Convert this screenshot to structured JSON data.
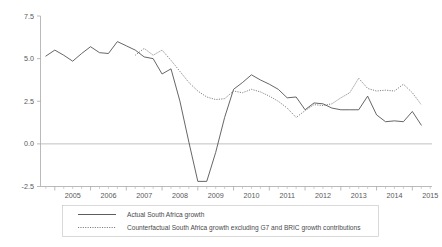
{
  "chart_data": {
    "type": "line",
    "title": "",
    "subtitle": "",
    "xlabel": "",
    "ylabel": "",
    "ylim": [
      -2.5,
      7.5
    ],
    "xlim": [
      "2004Q4",
      "2015Q2"
    ],
    "grid": false,
    "legend_position": "bottom",
    "y_ticks": [
      "7.5",
      "5.0",
      "2.5",
      "0.0",
      "-2.5"
    ],
    "y_tick_values": [
      7.5,
      5.0,
      2.5,
      0.0,
      -2.5
    ],
    "x_ticks": [
      "2005",
      "2006",
      "2007",
      "2008",
      "2009",
      "2010",
      "2011",
      "2012",
      "2013",
      "2014",
      "2015"
    ],
    "x_tick_values": [
      2005,
      2006,
      2007,
      2008,
      2009,
      2010,
      2011,
      2012,
      2013,
      2014,
      2015
    ],
    "x_minor_ticks_per_year": 4,
    "zero_line": 0.0,
    "series": [
      {
        "name": "Actual South Africa growth",
        "style": "solid",
        "color": "#4a4a4c",
        "x": [
          "2004Q4",
          "2005Q1",
          "2005Q2",
          "2005Q3",
          "2005Q4",
          "2006Q1",
          "2006Q2",
          "2006Q3",
          "2006Q4",
          "2007Q1",
          "2007Q2",
          "2007Q3",
          "2007Q4",
          "2008Q1",
          "2008Q2",
          "2008Q3",
          "2008Q4",
          "2009Q1",
          "2009Q2",
          "2009Q3",
          "2009Q4",
          "2010Q1",
          "2010Q2",
          "2010Q3",
          "2010Q4",
          "2011Q1",
          "2011Q2",
          "2011Q3",
          "2011Q4",
          "2012Q1",
          "2012Q2",
          "2012Q3",
          "2012Q4",
          "2013Q1",
          "2013Q2",
          "2013Q3",
          "2013Q4",
          "2014Q1",
          "2014Q2",
          "2014Q3",
          "2014Q4",
          "2015Q1",
          "2015Q2"
        ],
        "x_numeric": [
          2004.75,
          2005.0,
          2005.25,
          2005.5,
          2005.75,
          2006.0,
          2006.25,
          2006.5,
          2006.75,
          2007.0,
          2007.25,
          2007.5,
          2007.75,
          2008.0,
          2008.25,
          2008.5,
          2008.75,
          2009.0,
          2009.25,
          2009.5,
          2009.75,
          2010.0,
          2010.25,
          2010.5,
          2010.75,
          2011.0,
          2011.25,
          2011.5,
          2011.75,
          2012.0,
          2012.25,
          2012.5,
          2012.75,
          2013.0,
          2013.25,
          2013.5,
          2013.75,
          2014.0,
          2014.25,
          2014.5,
          2014.75,
          2015.0,
          2015.25
        ],
        "values": [
          5.15,
          5.5,
          5.2,
          4.85,
          5.3,
          5.7,
          5.35,
          5.3,
          6.0,
          5.75,
          5.5,
          5.1,
          5.0,
          4.1,
          4.4,
          2.5,
          0.1,
          -2.2,
          -2.2,
          -0.5,
          1.55,
          3.2,
          3.6,
          4.05,
          3.75,
          3.5,
          3.2,
          2.7,
          2.75,
          2.0,
          2.4,
          2.35,
          2.1,
          2.0,
          2.0,
          2.0,
          2.8,
          1.7,
          1.3,
          1.35,
          1.3,
          1.9,
          1.1
        ]
      },
      {
        "name": "Counterfactual South Africa growth excluding G7 and BRIC growth contributions",
        "style": "dotted",
        "color": "#6b6b6d",
        "x": [
          "2007Q2",
          "2007Q3",
          "2007Q4",
          "2008Q1",
          "2008Q2",
          "2008Q3",
          "2008Q4",
          "2009Q1",
          "2009Q2",
          "2009Q3",
          "2009Q4",
          "2010Q1",
          "2010Q2",
          "2010Q3",
          "2010Q4",
          "2011Q1",
          "2011Q2",
          "2011Q3",
          "2011Q4",
          "2012Q1",
          "2012Q2",
          "2012Q3",
          "2012Q4",
          "2013Q1",
          "2013Q2",
          "2013Q3",
          "2013Q4",
          "2014Q1",
          "2014Q2",
          "2014Q3",
          "2014Q4",
          "2015Q1",
          "2015Q2"
        ],
        "x_numeric": [
          2007.25,
          2007.5,
          2007.75,
          2008.0,
          2008.25,
          2008.5,
          2008.75,
          2009.0,
          2009.25,
          2009.5,
          2009.75,
          2010.0,
          2010.25,
          2010.5,
          2010.75,
          2011.0,
          2011.25,
          2011.5,
          2011.75,
          2012.0,
          2012.25,
          2012.5,
          2012.75,
          2013.0,
          2013.25,
          2013.5,
          2013.75,
          2014.0,
          2014.25,
          2014.5,
          2014.75,
          2015.0,
          2015.25
        ],
        "values": [
          5.2,
          5.6,
          5.2,
          5.5,
          4.9,
          4.25,
          3.6,
          3.1,
          2.75,
          2.6,
          2.65,
          3.1,
          3.0,
          3.2,
          3.05,
          2.8,
          2.5,
          2.1,
          1.55,
          1.95,
          2.3,
          2.25,
          2.35,
          2.7,
          3.0,
          3.85,
          3.25,
          3.1,
          3.15,
          3.1,
          3.5,
          3.0,
          2.3
        ]
      }
    ]
  },
  "legend": {
    "entries": [
      {
        "label": "Actual South Africa growth",
        "style": "solid"
      },
      {
        "label": "Counterfactual South Africa growth excluding G7 and BRIC growth contributions",
        "style": "dotted"
      }
    ]
  },
  "colors": {
    "actual": "#4a4a4c",
    "counterfactual": "#6b6b6d",
    "axis": "#a8a8aa",
    "background": "#ffffff"
  }
}
